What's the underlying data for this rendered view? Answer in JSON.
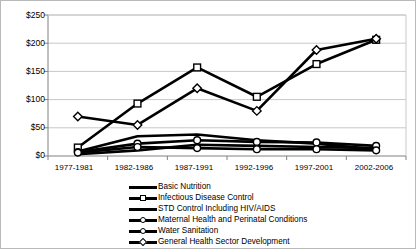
{
  "chart_data": {
    "type": "line",
    "title": "",
    "xlabel": "",
    "ylabel": "",
    "ylim": [
      0,
      250
    ],
    "ytick_labels": [
      "$0",
      "$50",
      "$100",
      "$150",
      "$200",
      "$250"
    ],
    "ytick_values": [
      0,
      50,
      100,
      150,
      200,
      250
    ],
    "grid": true,
    "legend_position": "bottom",
    "categories": [
      "1977-1981",
      "1982-1986",
      "1987-1991",
      "1992-1996",
      "1997-2001",
      "2002-2006"
    ],
    "series": [
      {
        "name": "Basic Nutrition",
        "marker": "none",
        "values": [
          8,
          35,
          38,
          28,
          22,
          12
        ]
      },
      {
        "name": "Infectious Disease Control",
        "marker": "square",
        "values": [
          15,
          93,
          157,
          105,
          163,
          206
        ]
      },
      {
        "name": "STD Control Including HIV/AIDS",
        "marker": "none",
        "values": [
          3,
          10,
          20,
          18,
          16,
          14
        ]
      },
      {
        "name": "Maternal Health and Perinatal Conditions",
        "marker": "circle",
        "values": [
          7,
          22,
          28,
          25,
          24,
          18
        ]
      },
      {
        "name": "Water Sanitation",
        "marker": "circle",
        "values": [
          6,
          16,
          14,
          12,
          12,
          10
        ]
      },
      {
        "name": "General Health Sector Development",
        "marker": "diamond",
        "values": [
          70,
          55,
          120,
          80,
          188,
          208
        ]
      }
    ]
  },
  "colors": {
    "line": "#000000",
    "marker_fill": "#ffffff",
    "grid": "#c8c8c8",
    "axis": "#808080",
    "border": "#b9b9b9",
    "background": "#ffffff"
  }
}
